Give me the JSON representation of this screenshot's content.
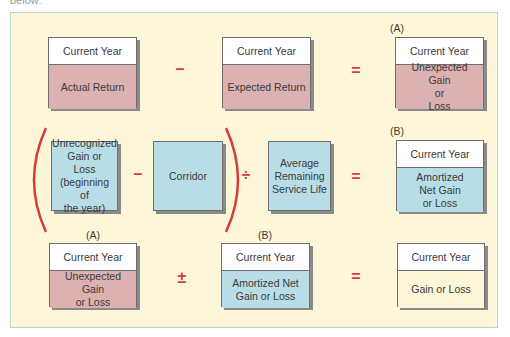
{
  "cut_text": "below:",
  "row1": {
    "box1": {
      "header": "Current Year",
      "body": "Actual Return"
    },
    "op1": "–",
    "box2": {
      "header": "Current Year",
      "body": "Expected Return"
    },
    "op2": "=",
    "label3": "(A)",
    "box3": {
      "header": "Current Year",
      "body_lines": [
        "Unexpected Gain",
        "or",
        "Loss"
      ]
    }
  },
  "row2": {
    "box1": {
      "body_lines": [
        "Unrecognized",
        "Gain or Loss",
        "(beginning of",
        "the year)"
      ]
    },
    "op1": "–",
    "box2": {
      "body": "Corridor"
    },
    "op2": "÷",
    "box3": {
      "body_lines": [
        "Average",
        "Remaining",
        "Service Life"
      ]
    },
    "op3": "=",
    "label4": "(B)",
    "box4": {
      "header": "Current Year",
      "body_lines": [
        "Amortized",
        "Net Gain",
        "or Loss"
      ]
    }
  },
  "row3": {
    "label1": "(A)",
    "box1": {
      "header": "Current Year",
      "body_lines": [
        "Unexpected Gain",
        "or Loss"
      ]
    },
    "op1": "±",
    "label2": "(B)",
    "box2": {
      "header": "Current Year",
      "body_lines": [
        "Amortized Net",
        "Gain or Loss"
      ]
    },
    "op2": "=",
    "box3": {
      "header": "Current Year",
      "body": "Gain or Loss"
    }
  },
  "colors": {
    "frame_bg": "#fdf6d8",
    "frame_border": "#b8d8cf",
    "pink": "#dcb1b1",
    "blue": "#b8dde6",
    "operator": "#d63b3b"
  }
}
